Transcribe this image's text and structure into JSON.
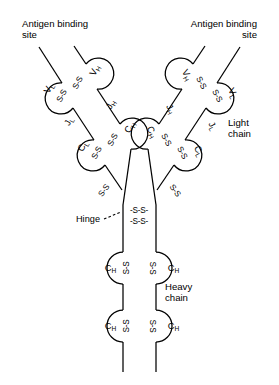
{
  "figure": {
    "background_color": "#ffffff",
    "line_color": "#000000",
    "width": 279,
    "height": 385
  },
  "callouts": {
    "antigen_left": {
      "line1": "Antigen binding",
      "line2": "site"
    },
    "antigen_right": {
      "line1": "Antigen binding",
      "line2": "site"
    },
    "light_chain": {
      "line1": "Light",
      "line2": "chain"
    },
    "heavy_chain": {
      "line1": "Heavy",
      "line2": "chain"
    },
    "hinge": {
      "label": "Hinge"
    }
  },
  "domains": {
    "left_arm": [
      {
        "name": "V",
        "subscript": "L",
        "chain": "light",
        "region": "variable"
      },
      {
        "name": "V",
        "subscript": "H",
        "chain": "heavy",
        "region": "variable"
      },
      {
        "name": "C",
        "subscript": "L",
        "chain": "light",
        "region": "constant"
      },
      {
        "name": "C",
        "subscript": "H",
        "chain": "heavy",
        "region": "constant"
      }
    ],
    "right_arm": [
      {
        "name": "V",
        "subscript": "H",
        "chain": "heavy",
        "region": "variable"
      },
      {
        "name": "V",
        "subscript": "L",
        "chain": "light",
        "region": "variable"
      },
      {
        "name": "C",
        "subscript": "H",
        "chain": "heavy",
        "region": "constant"
      },
      {
        "name": "C",
        "subscript": "L",
        "chain": "light",
        "region": "constant"
      }
    ],
    "stem_left": [
      {
        "name": "C",
        "subscript": "H",
        "chain": "heavy",
        "region": "constant"
      },
      {
        "name": "C",
        "subscript": "H",
        "chain": "heavy",
        "region": "constant"
      }
    ],
    "stem_right": [
      {
        "name": "C",
        "subscript": "H",
        "chain": "heavy",
        "region": "constant"
      },
      {
        "name": "C",
        "subscript": "H",
        "chain": "heavy",
        "region": "constant"
      }
    ]
  },
  "joining_labels": {
    "left_jl": {
      "name": "J",
      "subscript": "L"
    },
    "left_jh": {
      "name": "J",
      "subscript": "H"
    },
    "right_jh": {
      "name": "J",
      "subscript": "H"
    },
    "right_jl": {
      "name": "J",
      "subscript": "L"
    }
  },
  "disulfide_bonds": {
    "short_label": "S-S",
    "hinge_label": "-S-S-",
    "count_variable_region": 4,
    "count_constant_region": 4,
    "count_hinge": 2,
    "count_stem": 4
  }
}
